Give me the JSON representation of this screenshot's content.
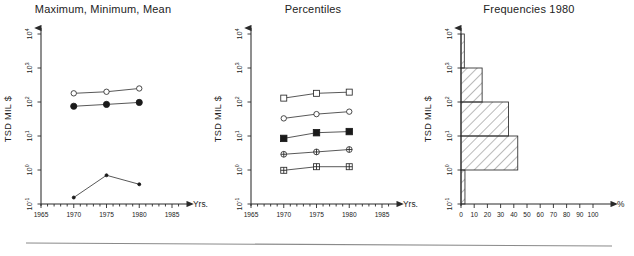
{
  "figure": {
    "width": 634,
    "height": 256,
    "background": "#ffffff",
    "ink_color": "#1a1a1a",
    "bottom_rule": true
  },
  "common": {
    "y_axis_title": "TSD MIL $",
    "y_ticks": [
      "10⁻¹",
      "10⁰",
      "10¹",
      "10²",
      "10³",
      "10⁴"
    ],
    "y_exponents": [
      "-1",
      "0",
      "1",
      "2",
      "3",
      "4"
    ],
    "y_base": "10",
    "x_axis_name_years": "Yrs.",
    "x_axis_name_percent": "%",
    "year_ticks": [
      "1965",
      "1970",
      "1975",
      "1980",
      "1985"
    ],
    "percent_ticks": [
      "0",
      "10",
      "20",
      "30",
      "40",
      "50",
      "60",
      "70",
      "80",
      "90",
      "100"
    ]
  },
  "chart_data": [
    {
      "type": "line",
      "title": "Maximum, Minimum, Mean",
      "xlabel": "Yrs.",
      "ylabel": "TSD MIL $",
      "yscale": "log",
      "ylim": [
        0.1,
        10000
      ],
      "xlim": [
        1965,
        1987
      ],
      "grid": false,
      "legend": "none",
      "x": [
        1970,
        1975,
        1980
      ],
      "series": [
        {
          "name": "Maximum",
          "marker": "open-circle",
          "values": [
            180,
            200,
            250
          ]
        },
        {
          "name": "Mean",
          "marker": "filled-circle",
          "values": [
            75,
            85,
            97
          ]
        },
        {
          "name": "Minimum",
          "marker": "small-dot",
          "values": [
            0.155,
            0.7,
            0.38
          ]
        }
      ]
    },
    {
      "type": "line",
      "title": "Percentiles",
      "xlabel": "Yrs.",
      "ylabel": "TSD MIL $",
      "yscale": "log",
      "ylim": [
        0.1,
        10000
      ],
      "xlim": [
        1965,
        1987
      ],
      "grid": false,
      "legend": "none",
      "x": [
        1970,
        1975,
        1980
      ],
      "series": [
        {
          "name": "P95",
          "marker": "open-square",
          "values": [
            130,
            180,
            195
          ]
        },
        {
          "name": "P75",
          "marker": "open-circle",
          "values": [
            33,
            44,
            52
          ]
        },
        {
          "name": "P50",
          "marker": "filled-square",
          "values": [
            8.5,
            12.5,
            13.5
          ]
        },
        {
          "name": "P25",
          "marker": "crossed-circle",
          "values": [
            2.9,
            3.4,
            4.0
          ]
        },
        {
          "name": "P5",
          "marker": "crossed-square",
          "values": [
            0.98,
            1.25,
            1.25
          ]
        }
      ]
    },
    {
      "type": "bar",
      "orientation": "horizontal",
      "title": "Frequencies 1980",
      "xlabel": "%",
      "ylabel": "TSD MIL $",
      "yscale": "log",
      "ylim": [
        0.1,
        10000
      ],
      "xlim": [
        0,
        105
      ],
      "grid": false,
      "legend": "none",
      "categories": [
        "10⁻¹–10⁰",
        "10⁰–10¹",
        "10¹–10²",
        "10²–10³",
        "10³–10⁴"
      ],
      "values": [
        3,
        43,
        36,
        16,
        2.5
      ],
      "fill": "diagonal-hatch"
    }
  ]
}
